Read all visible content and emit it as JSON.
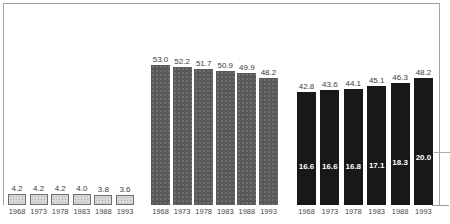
{
  "figure": {
    "background_color": "#ffffff",
    "frame_color": "#a3a3a3"
  },
  "chart_data": {
    "type": "bar",
    "title": "",
    "xlabel": "",
    "ylabel": "",
    "categories": [
      "1968",
      "1973",
      "1978",
      "1983",
      "1988",
      "1993"
    ],
    "series": [
      {
        "name": "light-stippled-bars",
        "style": "stippled-light",
        "values": [
          4.2,
          4.2,
          4.2,
          4.0,
          3.8,
          3.6
        ],
        "labels": [
          "4.2",
          "4.2",
          "4.2",
          "4.0",
          "3.8",
          "3.6"
        ]
      },
      {
        "name": "gray-bars",
        "style": "solid-gray",
        "values": [
          53.0,
          52.2,
          51.7,
          50.9,
          49.9,
          48.2
        ],
        "labels": [
          "53.0",
          "52.2",
          "51.7",
          "50.9",
          "49.9",
          "48.2"
        ]
      },
      {
        "name": "black-bars",
        "style": "solid-black",
        "values": [
          42.8,
          43.6,
          44.1,
          45.1,
          46.3,
          48.2
        ],
        "labels": [
          "42.8",
          "43.6",
          "44.1",
          "45.1",
          "46.3",
          "48.2"
        ],
        "inner_values": [
          16.6,
          16.6,
          16.8,
          17.1,
          18.3,
          20.0
        ],
        "inner_labels": [
          "16.6",
          "16.6",
          "16.8",
          "17.1",
          "18.3",
          "20.0"
        ]
      }
    ],
    "right_side_tick_lines_at_values": [
      20.0,
      0.0
    ],
    "legend": "none",
    "grid": "off",
    "ylim": [
      0,
      76
    ],
    "colors": {
      "light_bar_fill": "#d9d9d9",
      "light_bar_border": "#6e6e6e",
      "gray_bar": "#595959",
      "black_bar": "#181818",
      "value_label": "#3c3c3c",
      "inner_label": "#ffffff",
      "year_label": "#474747"
    }
  }
}
